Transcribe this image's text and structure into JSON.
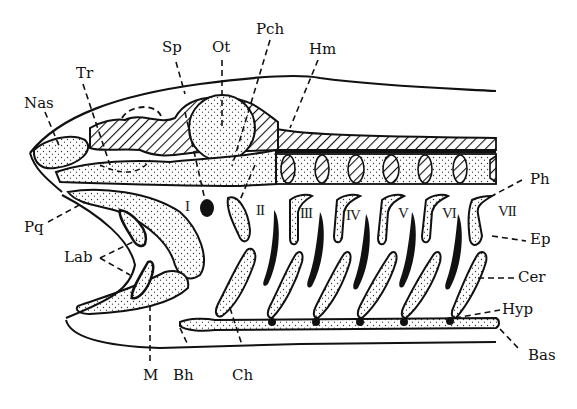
{
  "figure": {
    "colors": {
      "ink": "#111111",
      "background": "#ffffff",
      "stipple": "#333333"
    }
  },
  "labels": {
    "nas": "Nas",
    "tr": "Tr",
    "sp": "Sp",
    "ot": "Ot",
    "pch": "Pch",
    "hm": "Hm",
    "ph": "Ph",
    "ep": "Ep",
    "cer": "Cer",
    "hyp": "Hyp",
    "bas": "Bas",
    "pq": "Pq",
    "lab": "Lab",
    "m": "M",
    "bh": "Bh",
    "ch": "Ch"
  },
  "arches": [
    "I",
    "II",
    "III",
    "IV",
    "V",
    "VI",
    "VII"
  ]
}
